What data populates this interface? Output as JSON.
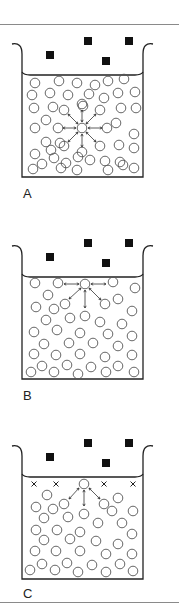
{
  "figure": {
    "panels": [
      {
        "id": "A",
        "label": "A",
        "top": 24,
        "description": "Molecule in bulk liquid attracted equally in all directions"
      },
      {
        "id": "B",
        "label": "B",
        "top": 226,
        "description": "Molecule at surface attracted sideways and downward"
      },
      {
        "id": "C",
        "label": "C",
        "top": 426,
        "description": "Surface molecules with x marks; net inward attraction"
      }
    ],
    "colors": {
      "stroke": "#555555",
      "solid": "#111111",
      "rule": "#8a8a8a"
    }
  }
}
